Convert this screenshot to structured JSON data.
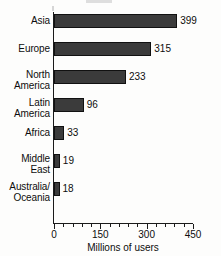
{
  "chart_data": {
    "type": "bar",
    "orientation": "horizontal",
    "title": "",
    "xlabel": "Millions of users",
    "ylabel": "",
    "xlim": [
      0,
      450
    ],
    "xticks": [
      0,
      150,
      300,
      450
    ],
    "xtick_labels": [
      "0",
      "150",
      "300",
      "450"
    ],
    "minor_tick_step": 30,
    "grid": false,
    "legend": null,
    "categories": [
      "Asia",
      "Europe",
      "North America",
      "Latin America",
      "Africa",
      "Middle East",
      "Australia/Oceania"
    ],
    "values": [
      399,
      315,
      233,
      96,
      33,
      19,
      18
    ],
    "bars": [
      {
        "label_lines": [
          "Asia"
        ],
        "value": 399,
        "value_label": "399"
      },
      {
        "label_lines": [
          "Europe"
        ],
        "value": 315,
        "value_label": "315"
      },
      {
        "label_lines": [
          "North",
          "America"
        ],
        "value": 233,
        "value_label": "233"
      },
      {
        "label_lines": [
          "Latin",
          "America"
        ],
        "value": 96,
        "value_label": "96"
      },
      {
        "label_lines": [
          "Africa"
        ],
        "value": 33,
        "value_label": "33"
      },
      {
        "label_lines": [
          "Middle",
          "East"
        ],
        "value": 19,
        "value_label": "19"
      },
      {
        "label_lines": [
          "Australia/",
          "Oceania"
        ],
        "value": 18,
        "value_label": "18"
      }
    ],
    "colors": {
      "bar_fill": "#3b3b3b",
      "bar_edge": "#111111",
      "axis": "#1a1a1a",
      "text": "#0d0d0d",
      "background": "#fdfdfc"
    }
  }
}
